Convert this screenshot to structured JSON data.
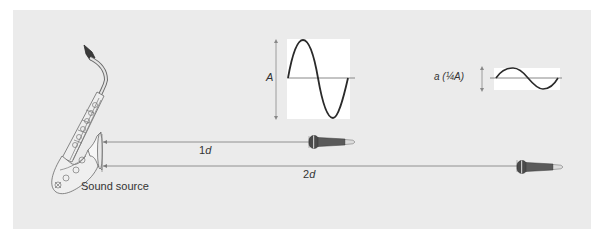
{
  "figure": {
    "background": "#ebebeb",
    "source": {
      "label": "Sound source",
      "instrument": "saxophone-icon"
    },
    "waveforms": [
      {
        "id": "near",
        "amplitude_label": "A",
        "relative_amplitude": 1.0
      },
      {
        "id": "far",
        "amplitude_label": "a (¼A)",
        "relative_amplitude": 0.25
      }
    ],
    "distances": [
      {
        "label": "1d",
        "multiplier": 1,
        "receiver": "microphone-icon"
      },
      {
        "label": "2d",
        "multiplier": 2,
        "receiver": "microphone-icon"
      }
    ],
    "labels": {
      "amp_big_letter": "A",
      "amp_small_main": "a",
      "amp_small_paren": "(¼A)",
      "dist1_num": "1",
      "dist1_var": "d",
      "dist2_num": "2",
      "dist2_var": "d",
      "source": "Sound source"
    },
    "colors": {
      "line": "#6e6e6e",
      "wave": "#2a2a2a",
      "mic_body": "#555555",
      "mic_tip": "#d9d9d9"
    }
  }
}
